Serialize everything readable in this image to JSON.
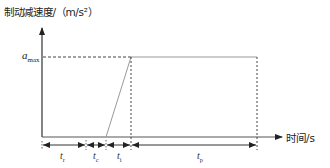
{
  "diagram": {
    "y_axis_label": "制动减速度/（m/s²）",
    "x_axis_label": "时间/s",
    "level_label": {
      "base": "a",
      "sub": "max"
    },
    "intervals": [
      {
        "base": "t",
        "sub": "r"
      },
      {
        "base": "t",
        "sub": "c"
      },
      {
        "base": "t",
        "sub": "i"
      },
      {
        "base": "t",
        "sub": "p"
      }
    ],
    "colors": {
      "axis": "#333333",
      "line": "#999999",
      "dashed": "#444444"
    }
  }
}
